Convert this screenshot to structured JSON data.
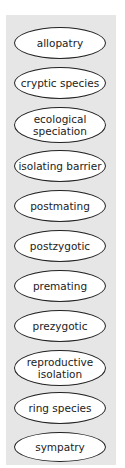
{
  "panel": {
    "background": "#e6e6e6"
  },
  "terms": [
    {
      "label": "allopatry",
      "top": 27,
      "height": 32
    },
    {
      "label": "cryptic species",
      "top": 67,
      "height": 32
    },
    {
      "label": "ecological speciation",
      "top": 107,
      "height": 34
    },
    {
      "label": "isolating barrier",
      "top": 150,
      "height": 32
    },
    {
      "label": "postmating",
      "top": 190,
      "height": 32
    },
    {
      "label": "postzygotic",
      "top": 230,
      "height": 32
    },
    {
      "label": "premating",
      "top": 270,
      "height": 32
    },
    {
      "label": "prezygotic",
      "top": 310,
      "height": 32
    },
    {
      "label": "reproductive isolation",
      "top": 350,
      "height": 34
    },
    {
      "label": "ring species",
      "top": 392,
      "height": 32
    },
    {
      "label": "sympatry",
      "top": 432,
      "height": 32
    }
  ]
}
